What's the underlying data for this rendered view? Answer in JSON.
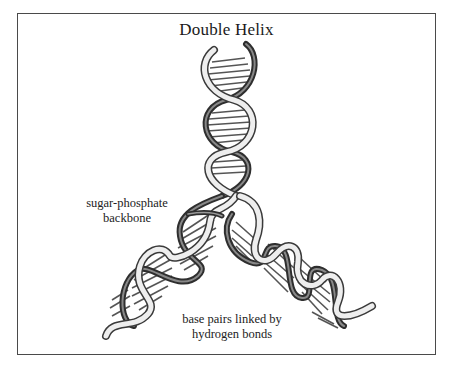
{
  "diagram": {
    "title": "Double Helix",
    "labels": {
      "backbone": [
        "sugar-phosphate",
        "backbone"
      ],
      "base_pairs": [
        "base pairs linked by",
        "hydrogen bonds"
      ]
    },
    "colors": {
      "border": "#4a4a4a",
      "ribbon_light": "#e8e8e8",
      "ribbon_dark": "#3a3a3a",
      "rung": "#555555",
      "text": "#222222"
    },
    "structure": {
      "type": "double-helix-replication-fork",
      "arms": [
        "top",
        "lower-left",
        "lower-right"
      ]
    }
  }
}
